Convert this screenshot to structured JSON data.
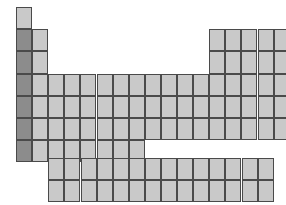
{
  "figure": {
    "name": "periodic-table-outline",
    "type": "blank-periodic-table-grid",
    "canvas": {
      "width": 286,
      "height": 205
    }
  },
  "colors": {
    "background": "#ffffff",
    "cell_fill": "#c9c9c9",
    "cell_fill_highlight": "#8c8c8c",
    "cell_border": "#4a4a4a"
  },
  "geometry": {
    "cell_width": 16.1,
    "cell_height": 22.2,
    "main_origin_x": 16,
    "main_origin_y": 7,
    "fblock_origin_x": 48.3,
    "fblock_origin_y": 158,
    "main_columns": 18,
    "main_rows": 7,
    "fblock_columns": 14,
    "fblock_rows": 2
  },
  "main_block": {
    "label": "main-periodic-grid",
    "rows": [
      {
        "period": 1,
        "groups": [
          1,
          18
        ]
      },
      {
        "period": 2,
        "groups": [
          1,
          2,
          13,
          14,
          15,
          16,
          17,
          18
        ]
      },
      {
        "period": 3,
        "groups": [
          1,
          2,
          13,
          14,
          15,
          16,
          17,
          18
        ]
      },
      {
        "period": 4,
        "groups": [
          1,
          2,
          3,
          4,
          5,
          6,
          7,
          8,
          9,
          10,
          11,
          12,
          13,
          14,
          15,
          16,
          17,
          18
        ]
      },
      {
        "period": 5,
        "groups": [
          1,
          2,
          3,
          4,
          5,
          6,
          7,
          8,
          9,
          10,
          11,
          12,
          13,
          14,
          15,
          16,
          17,
          18
        ]
      },
      {
        "period": 6,
        "groups": [
          1,
          2,
          3,
          4,
          5,
          6,
          7,
          8,
          9,
          10,
          11,
          12,
          13,
          14,
          15,
          16,
          17,
          18
        ]
      },
      {
        "period": 7,
        "groups": [
          1,
          2,
          3,
          4,
          5,
          6,
          7,
          8
        ]
      }
    ],
    "highlighted_group": 1,
    "highlighted_periods": [
      2,
      3,
      4,
      5,
      6,
      7
    ]
  },
  "f_block": {
    "label": "f-block-grid",
    "rows": [
      {
        "series": "lanthanide-row",
        "count": 14
      },
      {
        "series": "actinide-row",
        "count": 14
      }
    ]
  }
}
